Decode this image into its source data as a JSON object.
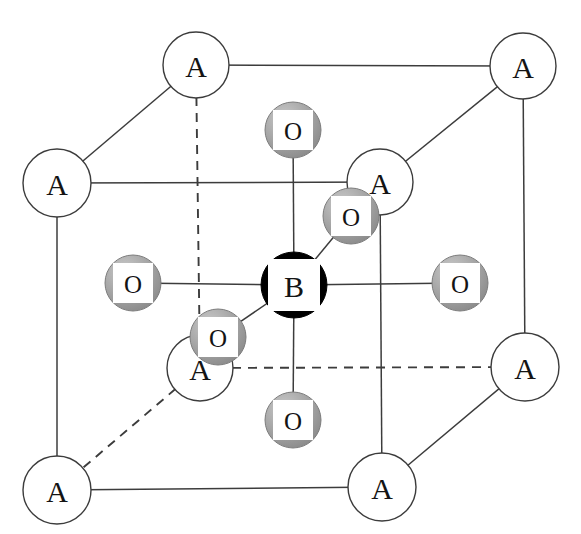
{
  "figure": {
    "kind": "crystal-structure-unit-cell",
    "background_color": "#ffffff",
    "line_color": "#3c3c3c",
    "dashed_line_color": "#3c3c3c"
  },
  "legend_colors": {
    "a_site_fill": "#ffffff",
    "a_site_stroke": "#3c3c3c",
    "b_site_fill": "#000000",
    "b_site_inner_fill": "#ffffff",
    "o_site_fill": "#9e9e9e",
    "o_site_inner_fill": "#ffffff",
    "text": "#141414"
  },
  "atoms": {
    "a_sites": [
      {
        "label": "A",
        "cx": 196,
        "cy": 65,
        "r": 33,
        "name": "a-site-back-top-left"
      },
      {
        "label": "A",
        "cx": 523,
        "cy": 66,
        "r": 33,
        "name": "a-site-back-top-right"
      },
      {
        "label": "A",
        "cx": 57,
        "cy": 183,
        "r": 34,
        "name": "a-site-front-top-left"
      },
      {
        "label": "A",
        "cx": 380,
        "cy": 182,
        "r": 33,
        "name": "a-site-front-top-right"
      },
      {
        "label": "A",
        "cx": 200,
        "cy": 368,
        "r": 33,
        "name": "a-site-back-bottom-left"
      },
      {
        "label": "A",
        "cx": 525,
        "cy": 367,
        "r": 34,
        "name": "a-site-back-bottom-right"
      },
      {
        "label": "A",
        "cx": 57,
        "cy": 490,
        "r": 34,
        "name": "a-site-front-bottom-left"
      },
      {
        "label": "A",
        "cx": 382,
        "cy": 487,
        "r": 34,
        "name": "a-site-front-bottom-right"
      }
    ],
    "b_site": {
      "label": "B",
      "cx": 294,
      "cy": 285,
      "r": 33,
      "square": 52,
      "name": "b-site-center"
    },
    "o_sites": [
      {
        "label": "O",
        "cx": 293,
        "cy": 130,
        "r": 28,
        "square": 40,
        "name": "o-site-top"
      },
      {
        "label": "O",
        "cx": 293,
        "cy": 420,
        "r": 28,
        "square": 40,
        "name": "o-site-bottom"
      },
      {
        "label": "O",
        "cx": 133,
        "cy": 283,
        "r": 28,
        "square": 40,
        "name": "o-site-left"
      },
      {
        "label": "O",
        "cx": 460,
        "cy": 283,
        "r": 28,
        "square": 40,
        "name": "o-site-right"
      },
      {
        "label": "O",
        "cx": 351,
        "cy": 216,
        "r": 28,
        "square": 40,
        "name": "o-site-back"
      },
      {
        "label": "O",
        "cx": 218,
        "cy": 337,
        "r": 28,
        "square": 40,
        "name": "o-site-front"
      }
    ]
  },
  "cube": {
    "solid_edges": [
      {
        "x1": 196,
        "y1": 65,
        "x2": 523,
        "y2": 66,
        "name": "edge-back-top"
      },
      {
        "x1": 57,
        "y1": 183,
        "x2": 380,
        "y2": 182,
        "name": "edge-front-top"
      },
      {
        "x1": 57,
        "y1": 490,
        "x2": 382,
        "y2": 487,
        "name": "edge-front-bottom"
      },
      {
        "x1": 196,
        "y1": 65,
        "x2": 57,
        "y2": 183,
        "name": "edge-top-left-diag"
      },
      {
        "x1": 523,
        "y1": 66,
        "x2": 380,
        "y2": 182,
        "name": "edge-top-right-diag"
      },
      {
        "x1": 525,
        "y1": 367,
        "x2": 382,
        "y2": 487,
        "name": "edge-bottom-right-diag"
      },
      {
        "x1": 57,
        "y1": 183,
        "x2": 57,
        "y2": 490,
        "name": "edge-front-left-vertical"
      },
      {
        "x1": 380,
        "y1": 182,
        "x2": 382,
        "y2": 487,
        "name": "edge-front-right-vertical"
      },
      {
        "x1": 523,
        "y1": 66,
        "x2": 525,
        "y2": 367,
        "name": "edge-back-right-vertical"
      }
    ],
    "dashed_edges": [
      {
        "x1": 196,
        "y1": 65,
        "x2": 200,
        "y2": 368,
        "name": "hidden-edge-back-left-vertical"
      },
      {
        "x1": 200,
        "y1": 368,
        "x2": 525,
        "y2": 367,
        "name": "hidden-edge-back-bottom"
      },
      {
        "x1": 200,
        "y1": 368,
        "x2": 57,
        "y2": 490,
        "name": "hidden-edge-bottom-left-diag"
      }
    ]
  },
  "bonds": [
    {
      "x1": 294,
      "y1": 285,
      "x2": 293,
      "y2": 130,
      "name": "bond-b-to-o-top"
    },
    {
      "x1": 294,
      "y1": 285,
      "x2": 293,
      "y2": 420,
      "name": "bond-b-to-o-bottom"
    },
    {
      "x1": 294,
      "y1": 285,
      "x2": 133,
      "y2": 283,
      "name": "bond-b-to-o-left"
    },
    {
      "x1": 294,
      "y1": 285,
      "x2": 460,
      "y2": 283,
      "name": "bond-b-to-o-right"
    },
    {
      "x1": 294,
      "y1": 285,
      "x2": 351,
      "y2": 216,
      "name": "bond-b-to-o-back"
    },
    {
      "x1": 294,
      "y1": 285,
      "x2": 218,
      "y2": 337,
      "name": "bond-b-to-o-front"
    }
  ]
}
